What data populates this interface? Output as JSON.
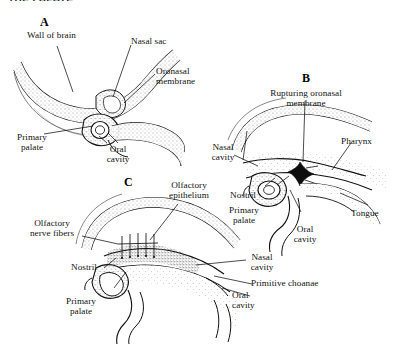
{
  "page": {
    "header_text": "THE PALATE",
    "background_color": "#ffffff",
    "ink_color": "#111111"
  },
  "figure": {
    "caption": "",
    "style": "pen-and-ink stippled anatomical line drawing",
    "panels": [
      {
        "letter": "A",
        "labels": [
          {
            "text": "Wall of brain"
          },
          {
            "text": "Nasal sac"
          },
          {
            "text": "Oronasal\nmembrane"
          },
          {
            "text": "Primary\npalate"
          },
          {
            "text": "Oral\ncavity"
          }
        ]
      },
      {
        "letter": "B",
        "labels": [
          {
            "text": "Rupturing oronasal\nmembrane"
          },
          {
            "text": "Pharynx"
          },
          {
            "text": "Nasal\ncavity"
          },
          {
            "text": "Nostril"
          },
          {
            "text": "Primary\npalate"
          },
          {
            "text": "Oral\ncavity"
          },
          {
            "text": "Tongue"
          }
        ]
      },
      {
        "letter": "C",
        "labels": [
          {
            "text": "Olfactory\nepithelium"
          },
          {
            "text": "Olfactory\nnerve fibers"
          },
          {
            "text": "Nostril"
          },
          {
            "text": "Nasal\ncavity"
          },
          {
            "text": "Primitive choanae"
          },
          {
            "text": "Primary\npalate"
          },
          {
            "text": "Oral\ncavity"
          }
        ]
      }
    ]
  },
  "labels": {
    "a_wall_of_brain": "Wall of brain",
    "a_nasal_sac": "Nasal sac",
    "a_oronasal_membrane": "Oronasal\nmembrane",
    "a_primary_palate": "Primary\npalate",
    "a_oral_cavity": "Oral\ncavity",
    "b_rupturing_oronasal_membrane": "Rupturing oronasal\nmembrane",
    "b_pharynx": "Pharynx",
    "b_nasal_cavity": "Nasal\ncavity",
    "b_nostril": "Nostril",
    "b_primary_palate": "Primary\npalate",
    "b_oral_cavity": "Oral\ncavity",
    "b_tongue": "Tongue",
    "c_olfactory_epithelium": "Olfactory\nepithelium",
    "c_olfactory_nerve_fibers": "Olfactory\nnerve fibers",
    "c_nostril": "Nostril",
    "c_nasal_cavity": "Nasal\ncavity",
    "c_primitive_choanae": "Primitive choanae",
    "c_primary_palate": "Primary\npalate",
    "c_oral_cavity": "Oral\ncavity"
  },
  "panel_letters": {
    "a": "A",
    "b": "B",
    "c": "C"
  }
}
